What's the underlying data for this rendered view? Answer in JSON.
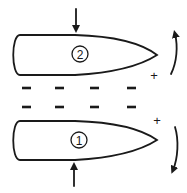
{
  "diagram": {
    "colors": {
      "ink": "#1a1a1a",
      "background": "#ffffff"
    },
    "bodies": [
      {
        "id": "top",
        "label": "2",
        "charge_at_tip": "+",
        "force_arrow": "down",
        "rotation_arrow": "up"
      },
      {
        "id": "bottom",
        "label": "1",
        "charge_at_tip": "+",
        "force_arrow": "up",
        "rotation_arrow": "down"
      }
    ],
    "gap_charges": {
      "upper_row": [
        "−",
        "−",
        "−",
        "−"
      ],
      "lower_row": [
        "−",
        "−",
        "−",
        "−"
      ]
    }
  }
}
